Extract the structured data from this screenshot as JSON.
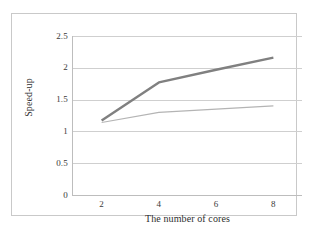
{
  "chart_data": {
    "type": "line",
    "title": "",
    "subtitle": "",
    "xlabel": "The number of cores",
    "ylabel": "Speed-up",
    "x": [
      2,
      4,
      6,
      8
    ],
    "xtick_labels": [
      "2",
      "4",
      "6",
      "8"
    ],
    "ytick_labels": [
      "0",
      "0.5",
      "1",
      "1.5",
      "2",
      "2.5"
    ],
    "ytick_values": [
      0,
      0.5,
      1,
      1.5,
      2,
      2.5
    ],
    "ylim": [
      0,
      2.5
    ],
    "xlim": [
      1,
      9
    ],
    "grid": "horizontal",
    "legend": "none",
    "series": [
      {
        "name": "series-1",
        "color": "#808080",
        "width": 2.4,
        "values": [
          1.17,
          1.77,
          1.97,
          2.16
        ]
      },
      {
        "name": "series-2",
        "color": "#b4b4b4",
        "width": 1.2,
        "values": [
          1.14,
          1.3,
          1.35,
          1.4
        ]
      }
    ],
    "colors": {
      "gridline": "#cfcfcf",
      "axis": "#bdbdbd",
      "frame": "#c9c9c9",
      "text": "#3a3a3a",
      "background": "#ffffff"
    }
  }
}
